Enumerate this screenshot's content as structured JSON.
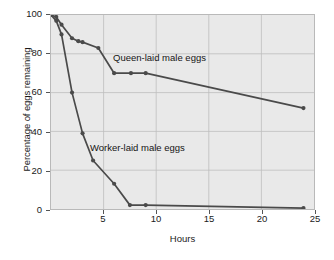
{
  "chart_data": {
    "type": "line",
    "title": "",
    "xlabel": "Hours",
    "ylabel": "Percentage of eggs remaining",
    "xlim": [
      0,
      25
    ],
    "ylim": [
      0,
      100
    ],
    "xticks": [
      5,
      10,
      15,
      20,
      25
    ],
    "yticks": [
      0,
      20,
      40,
      60,
      80,
      100
    ],
    "grid": true,
    "legend_position": "inline-annotations",
    "series": [
      {
        "name": "Queen-laid male eggs",
        "color": "#4a4a4a",
        "marker": "circle",
        "points": [
          {
            "x": 0.0,
            "y": 100
          },
          {
            "x": 0.5,
            "y": 99
          },
          {
            "x": 1.0,
            "y": 95
          },
          {
            "x": 2.0,
            "y": 88
          },
          {
            "x": 2.6,
            "y": 86.5
          },
          {
            "x": 3.0,
            "y": 86
          },
          {
            "x": 4.5,
            "y": 83
          },
          {
            "x": 6.0,
            "y": 70
          },
          {
            "x": 7.6,
            "y": 70
          },
          {
            "x": 9.0,
            "y": 70
          },
          {
            "x": 24.0,
            "y": 52
          }
        ]
      },
      {
        "name": "Worker-laid male eggs",
        "color": "#4a4a4a",
        "marker": "circle",
        "points": [
          {
            "x": 0.0,
            "y": 100
          },
          {
            "x": 0.5,
            "y": 97
          },
          {
            "x": 1.0,
            "y": 90
          },
          {
            "x": 2.0,
            "y": 60
          },
          {
            "x": 3.0,
            "y": 39
          },
          {
            "x": 4.0,
            "y": 25
          },
          {
            "x": 6.0,
            "y": 13
          },
          {
            "x": 7.5,
            "y": 2
          },
          {
            "x": 9.0,
            "y": 2
          },
          {
            "x": 24.0,
            "y": 0.5
          }
        ]
      }
    ],
    "annotations": [
      {
        "text": "Queen-laid male eggs",
        "x": 6.3,
        "y": 75
      },
      {
        "text": "Worker-laid male eggs",
        "x": 4.0,
        "y": 29
      }
    ]
  },
  "axis": {
    "x_title": "Hours",
    "y_title": "Percentage of eggs remaining",
    "x_tick_labels": [
      "5",
      "10",
      "15",
      "20",
      "25"
    ],
    "y_tick_labels": [
      "0",
      "20",
      "40",
      "60",
      "80",
      "100"
    ]
  },
  "labels": {
    "queen": "Queen-laid male eggs",
    "worker": "Worker-laid male eggs"
  },
  "colors": {
    "plot_background": "#e9e9e9",
    "grid": "#bdbdbd",
    "frame": "#b9b9b9",
    "line": "#4a4a4a",
    "text": "#1a1a1a"
  }
}
